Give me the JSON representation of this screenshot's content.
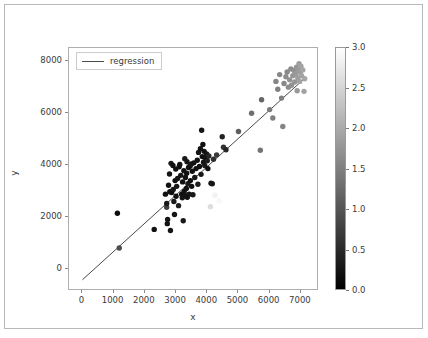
{
  "chart_data": {
    "type": "scatter",
    "title": "",
    "xlabel": "x",
    "ylabel": "y",
    "xlim": [
      -430,
      7580
    ],
    "ylim": [
      -830,
      8480
    ],
    "xticks": [
      0,
      1000,
      2000,
      3000,
      4000,
      5000,
      6000,
      7000
    ],
    "xtick_labels": [
      "0",
      "1000",
      "2000",
      "3000",
      "4000",
      "5000",
      "6000",
      "7000"
    ],
    "yticks": [
      0,
      2000,
      4000,
      6000,
      8000
    ],
    "ytick_labels": [
      "0",
      "2000",
      "4000",
      "6000",
      "8000"
    ],
    "grid": false,
    "legend": {
      "position": "upper left",
      "entries": [
        {
          "label": "regression",
          "marker": "line",
          "color": "#4a4a4a"
        }
      ]
    },
    "colorbar": {
      "colormap": "gray",
      "vmin": 0.0,
      "vmax": 3.0,
      "ticks": [
        0.0,
        0.5,
        1.0,
        1.5,
        2.0,
        2.5,
        3.0
      ],
      "tick_labels": [
        "0.0",
        "0.5",
        "1.0",
        "1.5",
        "2.0",
        "2.5",
        "3.0"
      ],
      "low_color": "#000000",
      "high_color": "#ffffff"
    },
    "regression_line": {
      "label": "regression",
      "color": "#4a4a4a",
      "x_start": 0,
      "y_start": -400,
      "x_end": 7160,
      "y_end": 7360,
      "slope": 1.084,
      "intercept": -400
    },
    "points": [
      {
        "x": 1120,
        "y": 2150,
        "c": 0.15
      },
      {
        "x": 1180,
        "y": 820,
        "c": 0.9
      },
      {
        "x": 2300,
        "y": 1530,
        "c": 0.2
      },
      {
        "x": 2660,
        "y": 2880,
        "c": 0.2
      },
      {
        "x": 2700,
        "y": 2380,
        "c": 0.75
      },
      {
        "x": 2700,
        "y": 2520,
        "c": 0.3
      },
      {
        "x": 2720,
        "y": 1750,
        "c": 0.2
      },
      {
        "x": 2730,
        "y": 1910,
        "c": 0.25
      },
      {
        "x": 2760,
        "y": 3220,
        "c": 0.2
      },
      {
        "x": 2790,
        "y": 3650,
        "c": 0.25
      },
      {
        "x": 2800,
        "y": 2970,
        "c": 0.2
      },
      {
        "x": 2820,
        "y": 1490,
        "c": 0.25
      },
      {
        "x": 2840,
        "y": 4060,
        "c": 0.3
      },
      {
        "x": 2860,
        "y": 2940,
        "c": 0.2
      },
      {
        "x": 2900,
        "y": 3980,
        "c": 0.2
      },
      {
        "x": 2910,
        "y": 3060,
        "c": 0.25
      },
      {
        "x": 2930,
        "y": 2600,
        "c": 0.3
      },
      {
        "x": 2950,
        "y": 2100,
        "c": 0.25
      },
      {
        "x": 2970,
        "y": 3400,
        "c": 0.2
      },
      {
        "x": 2990,
        "y": 3840,
        "c": 0.2
      },
      {
        "x": 3000,
        "y": 2800,
        "c": 0.2
      },
      {
        "x": 3020,
        "y": 3180,
        "c": 0.3
      },
      {
        "x": 3050,
        "y": 3480,
        "c": 0.25
      },
      {
        "x": 3080,
        "y": 2440,
        "c": 0.35
      },
      {
        "x": 3100,
        "y": 3930,
        "c": 0.2
      },
      {
        "x": 3120,
        "y": 4020,
        "c": 0.2
      },
      {
        "x": 3150,
        "y": 3600,
        "c": 0.25
      },
      {
        "x": 3180,
        "y": 2880,
        "c": 0.2
      },
      {
        "x": 3200,
        "y": 2740,
        "c": 0.25
      },
      {
        "x": 3210,
        "y": 3350,
        "c": 0.2
      },
      {
        "x": 3230,
        "y": 1860,
        "c": 0.3
      },
      {
        "x": 3250,
        "y": 3780,
        "c": 0.2
      },
      {
        "x": 3260,
        "y": 2980,
        "c": 0.2
      },
      {
        "x": 3280,
        "y": 4240,
        "c": 0.3
      },
      {
        "x": 3300,
        "y": 3520,
        "c": 0.2
      },
      {
        "x": 3310,
        "y": 2820,
        "c": 0.25
      },
      {
        "x": 3330,
        "y": 3100,
        "c": 0.2
      },
      {
        "x": 3340,
        "y": 3680,
        "c": 0.2
      },
      {
        "x": 3350,
        "y": 4120,
        "c": 0.25
      },
      {
        "x": 3360,
        "y": 2760,
        "c": 0.2
      },
      {
        "x": 3380,
        "y": 3280,
        "c": 0.3
      },
      {
        "x": 3400,
        "y": 3900,
        "c": 0.2
      },
      {
        "x": 3420,
        "y": 2880,
        "c": 0.25
      },
      {
        "x": 3450,
        "y": 3960,
        "c": 0.2
      },
      {
        "x": 3460,
        "y": 3400,
        "c": 0.2
      },
      {
        "x": 3490,
        "y": 4040,
        "c": 0.25
      },
      {
        "x": 3500,
        "y": 3180,
        "c": 0.2
      },
      {
        "x": 3520,
        "y": 3760,
        "c": 0.2
      },
      {
        "x": 3540,
        "y": 2860,
        "c": 0.3
      },
      {
        "x": 3570,
        "y": 4080,
        "c": 0.2
      },
      {
        "x": 3600,
        "y": 3520,
        "c": 0.25
      },
      {
        "x": 3640,
        "y": 3860,
        "c": 0.2
      },
      {
        "x": 3680,
        "y": 4180,
        "c": 0.2
      },
      {
        "x": 3700,
        "y": 3260,
        "c": 0.35
      },
      {
        "x": 3720,
        "y": 4480,
        "c": 0.25
      },
      {
        "x": 3750,
        "y": 3940,
        "c": 0.2
      },
      {
        "x": 3780,
        "y": 4620,
        "c": 0.2
      },
      {
        "x": 3800,
        "y": 3640,
        "c": 0.3
      },
      {
        "x": 3820,
        "y": 5330,
        "c": 0.25
      },
      {
        "x": 3840,
        "y": 4320,
        "c": 0.2
      },
      {
        "x": 3860,
        "y": 4780,
        "c": 0.2
      },
      {
        "x": 3880,
        "y": 4100,
        "c": 0.25
      },
      {
        "x": 3900,
        "y": 4520,
        "c": 0.2
      },
      {
        "x": 3920,
        "y": 3980,
        "c": 0.3
      },
      {
        "x": 3950,
        "y": 4260,
        "c": 0.2
      },
      {
        "x": 3980,
        "y": 4420,
        "c": 0.25
      },
      {
        "x": 4000,
        "y": 4160,
        "c": 0.35
      },
      {
        "x": 4020,
        "y": 3860,
        "c": 0.2
      },
      {
        "x": 4050,
        "y": 4340,
        "c": 0.45
      },
      {
        "x": 4100,
        "y": 2400,
        "c": 2.6
      },
      {
        "x": 4120,
        "y": 3300,
        "c": 0.3
      },
      {
        "x": 4160,
        "y": 3280,
        "c": 0.25
      },
      {
        "x": 4200,
        "y": 4220,
        "c": 0.55
      },
      {
        "x": 4250,
        "y": 2840,
        "c": 2.85
      },
      {
        "x": 4300,
        "y": 4380,
        "c": 0.7
      },
      {
        "x": 4380,
        "y": 2620,
        "c": 2.9
      },
      {
        "x": 4480,
        "y": 5080,
        "c": 0.4
      },
      {
        "x": 4520,
        "y": 4680,
        "c": 0.6
      },
      {
        "x": 4600,
        "y": 4580,
        "c": 0.45
      },
      {
        "x": 5000,
        "y": 5280,
        "c": 1.1
      },
      {
        "x": 5420,
        "y": 5980,
        "c": 1.3
      },
      {
        "x": 5700,
        "y": 4560,
        "c": 1.35
      },
      {
        "x": 5740,
        "y": 6500,
        "c": 1.2
      },
      {
        "x": 6000,
        "y": 6120,
        "c": 1.45
      },
      {
        "x": 6100,
        "y": 5800,
        "c": 1.5
      },
      {
        "x": 6200,
        "y": 7200,
        "c": 1.55
      },
      {
        "x": 6260,
        "y": 6900,
        "c": 1.5
      },
      {
        "x": 6320,
        "y": 7460,
        "c": 1.6
      },
      {
        "x": 6380,
        "y": 6560,
        "c": 1.5
      },
      {
        "x": 6420,
        "y": 5470,
        "c": 1.55
      },
      {
        "x": 6460,
        "y": 7120,
        "c": 1.6
      },
      {
        "x": 6520,
        "y": 7380,
        "c": 1.65
      },
      {
        "x": 6560,
        "y": 7560,
        "c": 1.6
      },
      {
        "x": 6600,
        "y": 6980,
        "c": 1.65
      },
      {
        "x": 6640,
        "y": 7260,
        "c": 1.7
      },
      {
        "x": 6680,
        "y": 7680,
        "c": 1.65
      },
      {
        "x": 6700,
        "y": 7050,
        "c": 1.7
      },
      {
        "x": 6740,
        "y": 7420,
        "c": 1.75
      },
      {
        "x": 6780,
        "y": 7620,
        "c": 1.7
      },
      {
        "x": 6800,
        "y": 7180,
        "c": 1.75
      },
      {
        "x": 6840,
        "y": 7500,
        "c": 1.8
      },
      {
        "x": 6860,
        "y": 7740,
        "c": 1.75
      },
      {
        "x": 6880,
        "y": 6840,
        "c": 1.8
      },
      {
        "x": 6900,
        "y": 7340,
        "c": 1.85
      },
      {
        "x": 6920,
        "y": 7660,
        "c": 1.8
      },
      {
        "x": 6940,
        "y": 7880,
        "c": 1.85
      },
      {
        "x": 6960,
        "y": 7200,
        "c": 1.9
      },
      {
        "x": 6980,
        "y": 7560,
        "c": 1.85
      },
      {
        "x": 7000,
        "y": 7780,
        "c": 1.9
      },
      {
        "x": 7020,
        "y": 7420,
        "c": 1.9
      },
      {
        "x": 7060,
        "y": 7640,
        "c": 1.95
      },
      {
        "x": 7100,
        "y": 6820,
        "c": 1.9
      },
      {
        "x": 7120,
        "y": 7300,
        "c": 1.95
      }
    ]
  }
}
